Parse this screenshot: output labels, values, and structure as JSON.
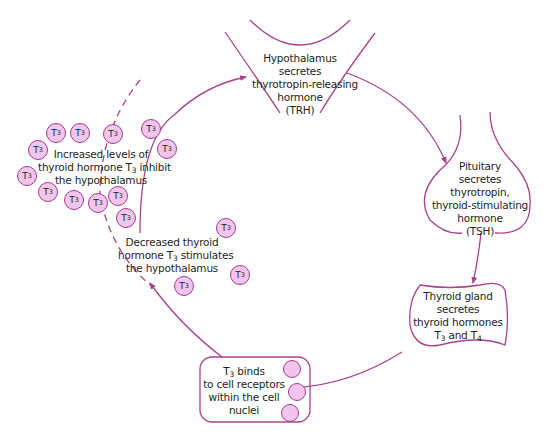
{
  "colors": {
    "line": "#a6438f",
    "bubble_fill": "#f2c6ec",
    "bubble_stroke": "#a03c8c",
    "text": "#231f20"
  },
  "nodes": {
    "hypothalamus": {
      "lines": [
        "Hypothalamus",
        "secretes",
        "thyrotropin-releasing",
        "hormone",
        "(TRH)"
      ]
    },
    "pituitary": {
      "lines": [
        "Pituitary",
        "secretes",
        "thyrotropin,",
        "thyroid-stimulating",
        "hormone",
        "(TSH)"
      ]
    },
    "thyroid": {
      "lines": [
        "Thyroid gland",
        "secretes",
        "thyroid hormones"
      ],
      "last_line": {
        "a": "T",
        "a_sub": "3",
        "mid": " and T",
        "b_sub": "4"
      }
    },
    "cell": {
      "first_line": {
        "t": "T",
        "sub": "3",
        "rest": " binds"
      },
      "lines": [
        "to cell receptors",
        "within the cell",
        "nuclei"
      ]
    }
  },
  "annotations": {
    "inhibit": {
      "line1": "Increased levels of",
      "line2_pre": "thyroid hormone T",
      "line2_sub": "3",
      "line2_post": " inhibit",
      "line3": "the hypothalamus"
    },
    "stimulate": {
      "line1": "Decreased thyroid",
      "line2_pre": "hormone T",
      "line2_sub": "3",
      "line2_post": " stimulates",
      "line3": "the hypothalamus"
    }
  },
  "hormone_bubble": {
    "label": "T",
    "sub": "3"
  },
  "bubbles_count": 19
}
